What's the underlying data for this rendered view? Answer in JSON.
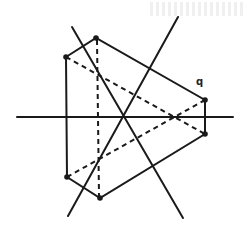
{
  "diagram": {
    "colors": {
      "ink": "#1a1a1a",
      "background": "#ffffff"
    },
    "labels": [
      {
        "text": "q",
        "x": 196,
        "y": 85
      }
    ],
    "points": {
      "A": [
        66,
        57
      ],
      "B": [
        96,
        38
      ],
      "C": [
        205,
        100
      ],
      "D": [
        205,
        134
      ],
      "E": [
        100,
        198
      ],
      "F": [
        67,
        177
      ],
      "O": [
        123,
        117
      ]
    }
  }
}
